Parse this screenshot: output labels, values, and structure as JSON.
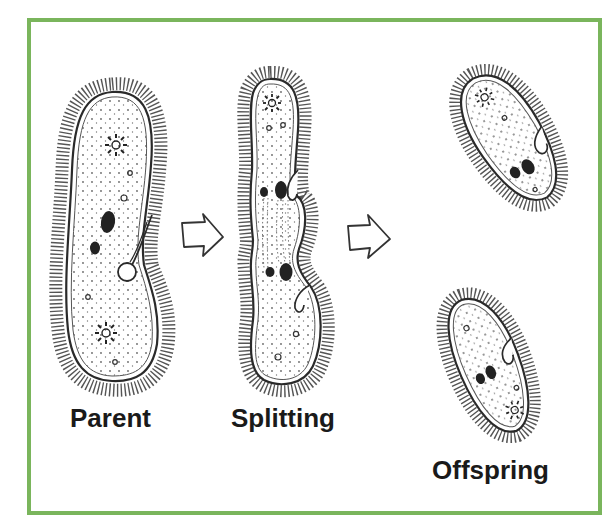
{
  "diagram": {
    "topic": "Binary fission of Paramecium",
    "frame_color": "#7ab55c",
    "stages": [
      {
        "id": "parent",
        "label": "Parent"
      },
      {
        "id": "splitting",
        "label": "Splitting"
      },
      {
        "id": "offspring",
        "label": "Offspring"
      }
    ],
    "arrows": [
      {
        "from": "parent",
        "to": "splitting",
        "icon": "hollow-right-arrow-icon"
      },
      {
        "from": "splitting",
        "to": "offspring",
        "icon": "hollow-right-arrow-icon"
      }
    ],
    "colors": {
      "outline": "#2a2a2a",
      "cilia": "#4a4a4a",
      "nucleus": "#222222",
      "label_text": "#1a1a1a",
      "background": "#ffffff"
    }
  }
}
